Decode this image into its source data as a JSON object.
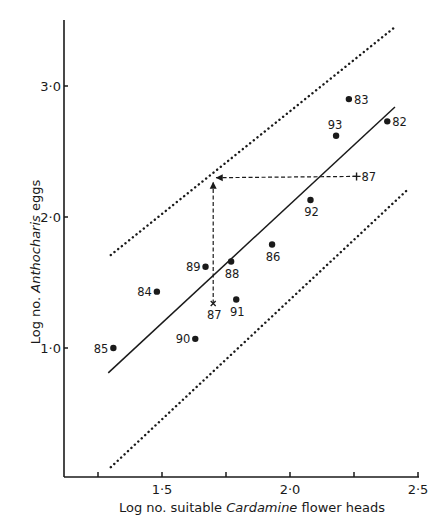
{
  "chart_data": {
    "type": "scatter",
    "title": "",
    "xlabel": "Log no. suitable Cardamine flower heads",
    "xlabel_parts": [
      {
        "text": "Log no. suitable ",
        "italic": false
      },
      {
        "text": "Cardamine",
        "italic": true
      },
      {
        "text": "  flower heads",
        "italic": false
      }
    ],
    "ylabel": "Log no. Anthocharis eggs",
    "ylabel_parts": [
      {
        "text": "Log no. ",
        "italic": false
      },
      {
        "text": "Anthocharis",
        "italic": true
      },
      {
        "text": " eggs",
        "italic": false
      }
    ],
    "xlim": [
      1.25,
      2.5
    ],
    "ylim": [
      0.0,
      3.5
    ],
    "x_ticks": [
      1.25,
      1.5,
      1.75,
      2.0,
      2.25,
      2.5
    ],
    "x_tick_labels": [
      {
        "value": 1.5,
        "label": "1·5"
      },
      {
        "value": 2.0,
        "label": "2·0"
      },
      {
        "value": 2.5,
        "label": "2·5"
      }
    ],
    "y_tick_labels": [
      {
        "value": 1.0,
        "label": "1·0"
      },
      {
        "value": 2.0,
        "label": "2·0"
      },
      {
        "value": 3.0,
        "label": "3·0"
      }
    ],
    "grid": false,
    "legend": null,
    "points": [
      {
        "label": "85",
        "x": 1.31,
        "y": 1.0,
        "marker": "dot",
        "label_pos": "left"
      },
      {
        "label": "84",
        "x": 1.48,
        "y": 1.43,
        "marker": "dot",
        "label_pos": "left"
      },
      {
        "label": "90",
        "x": 1.63,
        "y": 1.07,
        "marker": "dot",
        "label_pos": "left"
      },
      {
        "label": "89",
        "x": 1.67,
        "y": 1.62,
        "marker": "dot",
        "label_pos": "left"
      },
      {
        "label": "88",
        "x": 1.77,
        "y": 1.66,
        "marker": "dot",
        "label_pos": "below"
      },
      {
        "label": "91",
        "x": 1.79,
        "y": 1.37,
        "marker": "dot",
        "label_pos": "below"
      },
      {
        "label": "86",
        "x": 1.93,
        "y": 1.79,
        "marker": "dot",
        "label_pos": "below"
      },
      {
        "label": "92",
        "x": 2.08,
        "y": 2.13,
        "marker": "dot",
        "label_pos": "below"
      },
      {
        "label": "93",
        "x": 2.18,
        "y": 2.62,
        "marker": "dot",
        "label_pos": "above"
      },
      {
        "label": "83",
        "x": 2.23,
        "y": 2.9,
        "marker": "dot",
        "label_pos": "right"
      },
      {
        "label": "82",
        "x": 2.38,
        "y": 2.73,
        "marker": "dot",
        "label_pos": "right"
      },
      {
        "label": "87",
        "x": 1.7,
        "y": 1.34,
        "marker": "cross",
        "label_pos": "below"
      },
      {
        "label": "87",
        "x": 2.26,
        "y": 2.31,
        "marker": "plus",
        "label_pos": "right"
      }
    ],
    "regression_line": {
      "x": [
        1.29,
        2.41
      ],
      "y": [
        0.81,
        2.84
      ],
      "style": "solid"
    },
    "confidence_limits": [
      {
        "name": "upper",
        "x": [
          1.3,
          2.41
        ],
        "y": [
          1.71,
          3.45
        ],
        "style": "dotted"
      },
      {
        "name": "lower",
        "x": [
          1.3,
          2.46
        ],
        "y": [
          0.09,
          2.21
        ],
        "style": "dotted"
      }
    ],
    "annotations": [
      {
        "type": "dashed-arrow",
        "from": {
          "x": 1.7,
          "y": 1.34
        },
        "to": {
          "x": 1.7,
          "y": 2.27
        }
      },
      {
        "type": "dashed-arrow",
        "from": {
          "x": 2.26,
          "y": 2.31
        },
        "to": {
          "x": 1.71,
          "y": 2.3
        }
      }
    ]
  },
  "colors": {
    "ink": "#1a1a1a",
    "background": "#ffffff"
  }
}
